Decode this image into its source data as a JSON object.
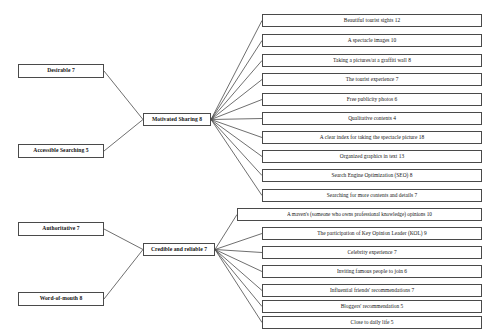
{
  "diagram": {
    "type": "hierarchy-tree",
    "orientation": "left-to-right",
    "title": "",
    "line_color": "#4a4a4a",
    "box_fill": "#ffffff",
    "text_color": "#141414"
  },
  "level1": [
    {
      "id": "desirable",
      "label": "Desirable 7",
      "value": 7,
      "x": 18,
      "y": 64,
      "w": 86,
      "parent_of": "motivated"
    },
    {
      "id": "accessible",
      "label": "Accessible Searching 5",
      "value": 5,
      "x": 18,
      "y": 144,
      "w": 86,
      "parent_of": "motivated"
    },
    {
      "id": "authoritative",
      "label": "Authoritative 7",
      "value": 7,
      "x": 18,
      "y": 222,
      "w": 86,
      "parent_of": "credible"
    },
    {
      "id": "wordofmouth",
      "label": "Word-of-mouth 8",
      "value": 8,
      "x": 18,
      "y": 292,
      "w": 86,
      "parent_of": "credible"
    }
  ],
  "level2": [
    {
      "id": "motivated",
      "label": "Motivated Sharing 8",
      "value": 8,
      "x": 143,
      "y": 113,
      "w": 68
    },
    {
      "id": "credible",
      "label": "Credible and reliable 7",
      "value": 7,
      "x": 143,
      "y": 243,
      "w": 72
    }
  ],
  "leaves": [
    {
      "label": "Beautiful tourist sights  12",
      "value": 12,
      "parent": "motivated",
      "x": 262,
      "y": 14,
      "w": 220
    },
    {
      "label": "A spectacle images 10",
      "value": 10,
      "parent": "motivated",
      "x": 262,
      "y": 34,
      "w": 220
    },
    {
      "label": "Taking a pictures/at a graffiti wall 8",
      "value": 8,
      "parent": "motivated",
      "x": 262,
      "y": 54,
      "w": 220
    },
    {
      "label": "The tourist experience  7",
      "value": 7,
      "parent": "motivated",
      "x": 262,
      "y": 73,
      "w": 220
    },
    {
      "label": "Free  publicity photos 6",
      "value": 6,
      "parent": "motivated",
      "x": 262,
      "y": 93,
      "w": 220
    },
    {
      "label": "Qualitative contents 4",
      "value": 4,
      "parent": "motivated",
      "x": 262,
      "y": 112,
      "w": 220
    },
    {
      "label": "A clear index for taking the spectacle picture 18",
      "value": 18,
      "parent": "motivated",
      "x": 262,
      "y": 131,
      "w": 220
    },
    {
      "label": "Organized graphics in text 13",
      "value": 13,
      "parent": "motivated",
      "x": 262,
      "y": 150,
      "w": 220
    },
    {
      "label": "Search Engine Optimization (SEO) 8",
      "value": 8,
      "parent": "motivated",
      "x": 262,
      "y": 169,
      "w": 220
    },
    {
      "label": "Searching for more contents and details 7",
      "value": 7,
      "parent": "motivated",
      "x": 262,
      "y": 189,
      "w": 220
    },
    {
      "label": "A maven's (someone who owns professional knowledge) opinions 10",
      "value": 10,
      "parent": "credible",
      "x": 237,
      "y": 208,
      "w": 245,
      "wide": true
    },
    {
      "label": "The participation of Key Opinion Leader (KOL) 9",
      "value": 9,
      "parent": "credible",
      "x": 262,
      "y": 227,
      "w": 220
    },
    {
      "label": "Celebrity experience 7",
      "value": 7,
      "parent": "credible",
      "x": 262,
      "y": 246,
      "w": 220
    },
    {
      "label": "Inviting famous people to join  6",
      "value": 6,
      "parent": "credible",
      "x": 262,
      "y": 265,
      "w": 220
    },
    {
      "label": "Influential friends' recommendations 7",
      "value": 7,
      "parent": "credible",
      "x": 262,
      "y": 284,
      "w": 220
    },
    {
      "label": "Bloggers' recommendation 5",
      "value": 5,
      "parent": "credible",
      "x": 262,
      "y": 300,
      "w": 220
    },
    {
      "label": "Close to daily life 5",
      "value": 5,
      "parent": "credible",
      "x": 262,
      "y": 316,
      "w": 220
    }
  ]
}
